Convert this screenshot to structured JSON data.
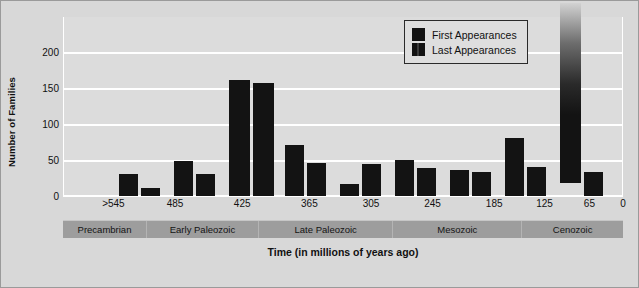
{
  "chart_data": {
    "type": "bar",
    "title": "",
    "xlabel": "Time (in millions of years ago)",
    "ylabel": "Number of Families",
    "ylim": [
      0,
      200
    ],
    "yticks": [
      0,
      50,
      100,
      150,
      200
    ],
    "grid": true,
    "xlim_labels": [
      ">545",
      "485",
      "425",
      "365",
      "305",
      "245",
      "185",
      "125",
      "65",
      "0"
    ],
    "legend_position": "top-right",
    "series": [
      {
        "name": "First Appearances",
        "color": "#131313",
        "values": [
          30,
          48,
          161,
          71,
          16,
          50,
          36,
          33,
          80,
          299
        ]
      },
      {
        "name": "Last Appearances",
        "color": "#131313",
        "values": [
          11,
          31,
          157,
          46,
          45,
          39,
          33,
          33,
          40,
          33
        ]
      }
    ],
    "annotations": [
      {
        "label": "299",
        "series": "First Appearances",
        "group_index": 9,
        "note": "bar exceeds axis maximum; drawn with faded top"
      }
    ],
    "bars": [
      {
        "name": "first-1",
        "value": 30,
        "x": 122,
        "width": 19,
        "overflow": false,
        "value_label": ""
      },
      {
        "name": "last-1",
        "value": 11,
        "x": 144,
        "width": 19,
        "overflow": false,
        "value_label": ""
      },
      {
        "name": "first-2",
        "value": 48,
        "x": 177,
        "width": 19,
        "overflow": false,
        "value_label": ""
      },
      {
        "name": "last-2",
        "value": 31,
        "x": 199,
        "width": 19,
        "overflow": false,
        "value_label": ""
      },
      {
        "name": "first-3",
        "value": 161,
        "x": 232,
        "width": 21,
        "overflow": false,
        "value_label": ""
      },
      {
        "name": "last-3",
        "value": 157,
        "x": 256,
        "width": 21,
        "overflow": false,
        "value_label": ""
      },
      {
        "name": "first-4",
        "value": 71,
        "x": 288,
        "width": 19,
        "overflow": false,
        "value_label": ""
      },
      {
        "name": "last-4",
        "value": 46,
        "x": 310,
        "width": 19,
        "overflow": false,
        "value_label": ""
      },
      {
        "name": "first-5",
        "value": 16,
        "x": 343,
        "width": 19,
        "overflow": false,
        "value_label": ""
      },
      {
        "name": "last-5",
        "value": 45,
        "x": 365,
        "width": 19,
        "overflow": false,
        "value_label": ""
      },
      {
        "name": "first-6",
        "value": 50,
        "x": 398,
        "width": 19,
        "overflow": false,
        "value_label": ""
      },
      {
        "name": "last-6",
        "value": 39,
        "x": 420,
        "width": 19,
        "overflow": false,
        "value_label": ""
      },
      {
        "name": "first-7",
        "value": 36,
        "x": 453,
        "width": 19,
        "overflow": false,
        "value_label": ""
      },
      {
        "name": "last-7",
        "value": 33,
        "x": 475,
        "width": 19,
        "overflow": false,
        "value_label": ""
      },
      {
        "name": "first-8",
        "value": 33,
        "x": 498,
        "width": 19,
        "overflow": false,
        "value_label": ""
      },
      {
        "name": "last-8",
        "value": 33,
        "x": 520,
        "width": 19,
        "overflow": false,
        "value_label": ""
      },
      {
        "name": "first-9",
        "value": 80,
        "x": 450,
        "width": 19,
        "overflow": false,
        "value_label": ""
      },
      {
        "name": "last-9",
        "value": 40,
        "x": 472,
        "width": 19,
        "overflow": false,
        "value_label": ""
      }
    ]
  },
  "axis": {
    "y_ticks": [
      {
        "label": "200",
        "value": 200
      },
      {
        "label": "150",
        "value": 150
      },
      {
        "label": "100",
        "value": 100
      },
      {
        "label": "50",
        "value": 50
      },
      {
        "label": "0",
        "value": 0
      }
    ],
    "x_ticks": [
      {
        "label": ">545",
        "pos": 9
      },
      {
        "label": "485",
        "pos": 20
      },
      {
        "label": "425",
        "pos": 32
      },
      {
        "label": "365",
        "pos": 44
      },
      {
        "label": "305",
        "pos": 55
      },
      {
        "label": "245",
        "pos": 66
      },
      {
        "label": "185",
        "pos": 77
      },
      {
        "label": "125",
        "pos": 86
      },
      {
        "label": "65",
        "pos": 94
      },
      {
        "label": "0",
        "pos": 100
      }
    ]
  },
  "legend": {
    "items": [
      {
        "label": "First Appearances",
        "swatch": "solid"
      },
      {
        "label": "Last Appearances",
        "swatch": "split"
      }
    ]
  },
  "eras": [
    {
      "label": "Precambrian",
      "width": 15
    },
    {
      "label": "Early Paleozoic",
      "width": 20
    },
    {
      "label": "Late Paleozoic",
      "width": 24
    },
    {
      "label": "Mesozoic",
      "width": 23
    },
    {
      "label": "Cenozoic",
      "width": 18
    }
  ],
  "colors": {
    "figure_background": "#d8d8d8",
    "panel_background": "#dcdcdc",
    "gridline": "#ffffff",
    "bar": "#131313",
    "era_band": "#9d9d9d",
    "text": "#111111"
  }
}
